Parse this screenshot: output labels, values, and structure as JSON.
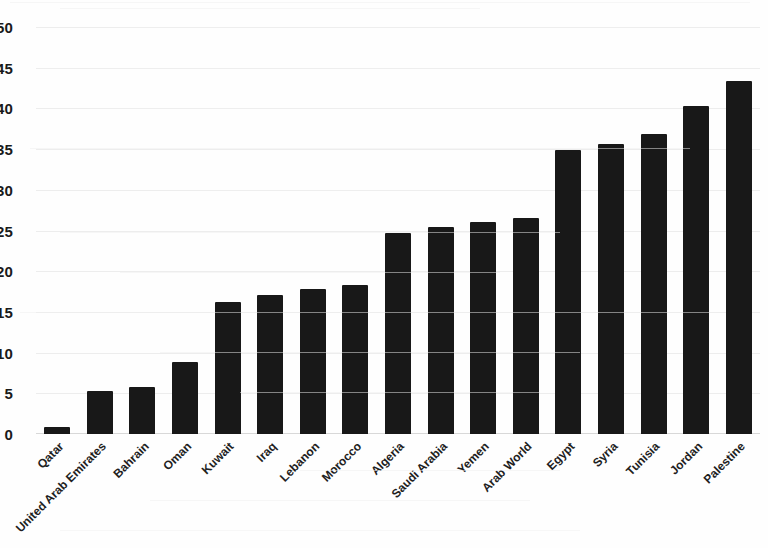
{
  "chart_data": {
    "type": "bar",
    "title": "",
    "subtitle": "",
    "xlabel": "",
    "ylabel": "",
    "ylim": [
      0,
      50
    ],
    "ytick_step": 5,
    "yticks": [
      "50",
      "45",
      "40",
      "35",
      "30",
      "25",
      "20",
      "15",
      "10",
      "5",
      "0"
    ],
    "grid": true,
    "grid_orientation": "horizontal",
    "legend": null,
    "legend_position": "none",
    "bar_color": "#181818",
    "categories": [
      "Qatar",
      "United Arab Emirates",
      "Bahrain",
      "Oman",
      "Kuwait",
      "Iraq",
      "Lebanon",
      "Morocco",
      "Algeria",
      "Saudi Arabia",
      "Yemen",
      "Arab World",
      "Egypt",
      "Syria",
      "Tunisia",
      "Jordan",
      "Palestine"
    ],
    "values": [
      0.9,
      5.3,
      5.8,
      8.8,
      16.2,
      17.1,
      17.8,
      18.3,
      24.7,
      25.4,
      26.0,
      26.5,
      34.9,
      35.6,
      36.8,
      40.3,
      43.4
    ]
  }
}
